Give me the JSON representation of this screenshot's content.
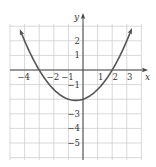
{
  "chart_data": {
    "type": "line",
    "title": "",
    "xlabel": "x",
    "ylabel": "y",
    "xlim": [
      -4.5,
      4.5
    ],
    "ylim": [
      -6.1,
      3.2
    ],
    "grid": true,
    "x_ticks": [
      -4,
      -2,
      -1,
      1,
      2,
      3
    ],
    "x_tick_labels": [
      "−4",
      "−2",
      "−1",
      "1",
      "2",
      "3"
    ],
    "y_ticks": [
      2,
      1,
      -1,
      -3,
      -4,
      -5
    ],
    "y_tick_labels": [
      "2",
      "1",
      "−1",
      "−3",
      "−4",
      "−5"
    ],
    "series": [
      {
        "name": "parabola",
        "description": "Upward-opening parabola with arrowheads at both ends, x-intercepts near -3 and 2, vertex near (-0.5, -2.1)",
        "equation": "y = (x^2 + x - 6) / 3",
        "x": [
          -4.3,
          -4,
          -3,
          -2,
          -1,
          -0.5,
          0,
          1,
          2,
          3,
          3.3
        ],
        "y": [
          2.3,
          2.0,
          0.0,
          -1.33,
          -2.0,
          -2.08,
          -2.0,
          -1.33,
          0.0,
          2.0,
          2.73
        ],
        "color": "#555555"
      }
    ]
  },
  "colors": {
    "curve": "#555555",
    "axis": "#444444",
    "grid": "#c8c8c8"
  }
}
